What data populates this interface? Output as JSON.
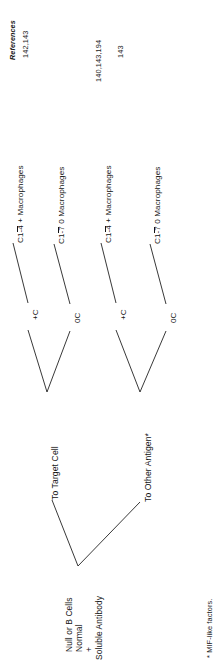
{
  "figure": {
    "orientation": "rotated-90-ccw",
    "type": "tree-diagram",
    "references_header": "References",
    "footnote": "* MIF-like factors."
  },
  "columns": {
    "references": [
      {
        "id": "ref-1",
        "value": "142,143"
      },
      {
        "id": "ref-2",
        "value": ""
      },
      {
        "id": "ref-3",
        "value": "140,143,194"
      },
      {
        "id": "ref-4",
        "value": "143"
      }
    ]
  },
  "tree": {
    "root": {
      "id": "root",
      "line1": "Null or B Cells",
      "line2": "Normal",
      "line3": "+",
      "line4": "Soluble Antibody"
    },
    "branches": [
      {
        "id": "branch-target-cell",
        "label": "To Target Cell",
        "nodes": [
          {
            "id": "node-target-plus-c",
            "label": "+C",
            "leaf": {
              "id": "leaf-c14-macrophages",
              "prefix": "C1",
              "overline": "-4",
              "suffix": " + Macrophages"
            }
          },
          {
            "id": "node-target-zero-c",
            "label": "0C",
            "leaf": {
              "id": "leaf-c17-macrophages",
              "prefix": "C1",
              "overline": "-7",
              "suffix": " 0  Macrophages"
            }
          }
        ]
      },
      {
        "id": "branch-other-antigen",
        "label": "To Other Antigen*",
        "nodes": [
          {
            "id": "node-antigen-plus-c",
            "label": "+C",
            "leaf": {
              "id": "leaf-c14-macrophages-2",
              "prefix": "C1",
              "overline": "-4",
              "suffix": " + Macrophages"
            }
          },
          {
            "id": "node-antigen-zero-c",
            "label": "0C",
            "leaf": {
              "id": "leaf-c17-macrophages-2",
              "prefix": "C1",
              "overline": "-7",
              "suffix": " 0  Macrophages"
            }
          }
        ]
      }
    ]
  }
}
